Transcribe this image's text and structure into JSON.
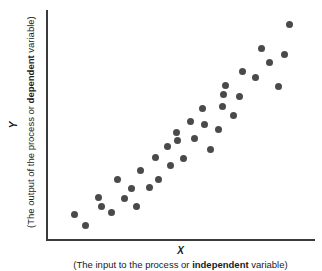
{
  "chart_data": {
    "type": "scatter",
    "title": "",
    "xlabel": "X",
    "ylabel": "Y",
    "xlabel_sub_prefix": "(The input to the process or ",
    "xlabel_sub_bold": "independent",
    "xlabel_sub_suffix": " variable)",
    "ylabel_sub_prefix": "(The output of the process or ",
    "ylabel_sub_bold": "dependent",
    "ylabel_sub_suffix": " variable)",
    "grid": false,
    "legend": false,
    "axes_shown": [
      "left",
      "bottom"
    ],
    "xlim": [
      0,
      100
    ],
    "ylim": [
      0,
      100
    ],
    "xticks": [],
    "yticks": [],
    "marker": "circle",
    "marker_color": "#4a4a4d",
    "marker_size": 7,
    "axis_color": "#3a3a3a",
    "background_color": "#ffffff",
    "n_points": 36,
    "points": [
      {
        "x": 10.1,
        "y": 10.5
      },
      {
        "x": 14.2,
        "y": 5.7
      },
      {
        "x": 19.1,
        "y": 18.3
      },
      {
        "x": 19.9,
        "y": 14.4
      },
      {
        "x": 23.6,
        "y": 11.4
      },
      {
        "x": 26.2,
        "y": 25.8
      },
      {
        "x": 28.8,
        "y": 17.5
      },
      {
        "x": 31.1,
        "y": 21.9
      },
      {
        "x": 33.2,
        "y": 14.0
      },
      {
        "x": 34.6,
        "y": 29.7
      },
      {
        "x": 38.0,
        "y": 22.4
      },
      {
        "x": 40.1,
        "y": 35.4
      },
      {
        "x": 41.3,
        "y": 26.2
      },
      {
        "x": 44.6,
        "y": 40.6
      },
      {
        "x": 45.8,
        "y": 31.9
      },
      {
        "x": 48.0,
        "y": 46.3
      },
      {
        "x": 48.4,
        "y": 43.2
      },
      {
        "x": 50.8,
        "y": 35.0
      },
      {
        "x": 53.4,
        "y": 51.1
      },
      {
        "x": 54.7,
        "y": 44.0
      },
      {
        "x": 57.9,
        "y": 56.9
      },
      {
        "x": 58.6,
        "y": 49.8
      },
      {
        "x": 60.9,
        "y": 39.2
      },
      {
        "x": 63.9,
        "y": 47.6
      },
      {
        "x": 65.4,
        "y": 57.9
      },
      {
        "x": 65.9,
        "y": 63.1
      },
      {
        "x": 66.4,
        "y": 67.1
      },
      {
        "x": 69.5,
        "y": 53.8
      },
      {
        "x": 71.9,
        "y": 62.1
      },
      {
        "x": 72.7,
        "y": 73.3
      },
      {
        "x": 77.8,
        "y": 70.7
      },
      {
        "x": 80.1,
        "y": 83.2
      },
      {
        "x": 82.9,
        "y": 77.0
      },
      {
        "x": 86.3,
        "y": 66.7
      },
      {
        "x": 88.5,
        "y": 80.6
      },
      {
        "x": 90.3,
        "y": 93.5
      }
    ]
  }
}
